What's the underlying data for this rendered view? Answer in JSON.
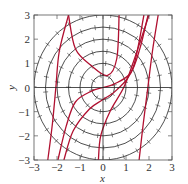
{
  "chart_data": {
    "type": "line",
    "title": "",
    "xlabel": "x",
    "ylabel": "y",
    "xlim": [
      -3,
      3
    ],
    "ylim": [
      -3,
      3
    ],
    "xticks": [
      "-3",
      "-2",
      "-1",
      "0",
      "1",
      "2",
      "3"
    ],
    "yticks": [
      "-3",
      "-2",
      "-1",
      "0",
      "1",
      "2",
      "3"
    ],
    "grid": false,
    "axes_lines_through_origin": true,
    "circles": {
      "description": "Concentric circles centered at origin with slope-field tick marks",
      "radii": [
        0.5,
        1.0,
        1.5,
        2.0,
        2.5,
        3.0
      ],
      "color": "#222222"
    },
    "series": [
      {
        "name": "solution-curve-1",
        "color": "#b01030",
        "points": [
          [
            -2.4,
            -3
          ],
          [
            -2.2,
            -1.5
          ],
          [
            -2.05,
            0
          ],
          [
            -1.9,
            1.5
          ],
          [
            -1.5,
            3
          ]
        ]
      },
      {
        "name": "solution-curve-2",
        "color": "#b01030",
        "points": [
          [
            -1.96,
            -3
          ],
          [
            -1.6,
            -1.6
          ],
          [
            -1.2,
            -0.6
          ],
          [
            -0.5,
            -0.15
          ],
          [
            0,
            0
          ],
          [
            0.5,
            0.15
          ],
          [
            1.2,
            0.6
          ],
          [
            1.6,
            1.6
          ],
          [
            1.96,
            3
          ]
        ]
      },
      {
        "name": "solution-curve-3",
        "color": "#b01030",
        "points": [
          [
            -1.7,
            -3
          ],
          [
            -1.3,
            -1.8
          ],
          [
            -0.6,
            -0.9
          ],
          [
            0,
            -0.5
          ],
          [
            0.6,
            -0.1
          ],
          [
            1.3,
            0.8
          ],
          [
            1.78,
            3
          ]
        ]
      },
      {
        "name": "solution-curve-4",
        "color": "#b01030",
        "points": [
          [
            -0.2,
            -3
          ],
          [
            -0.1,
            -2
          ],
          [
            0.3,
            -1
          ],
          [
            0.9,
            0
          ],
          [
            1.3,
            1
          ],
          [
            2.0,
            3
          ]
        ]
      },
      {
        "name": "solution-curve-5",
        "color": "#b01030",
        "points": [
          [
            1.57,
            -3
          ],
          [
            1.75,
            -1.5
          ],
          [
            1.95,
            0
          ],
          [
            2.15,
            1.5
          ],
          [
            2.4,
            3
          ]
        ]
      },
      {
        "name": "solution-curve-6",
        "color": "#b01030",
        "points": [
          [
            -1.5,
            3
          ],
          [
            -1.2,
            1.6
          ],
          [
            -0.5,
            0.9
          ],
          [
            0.2,
            0.5
          ],
          [
            0.6,
            1.2
          ],
          [
            0.7,
            3
          ]
        ]
      }
    ]
  }
}
